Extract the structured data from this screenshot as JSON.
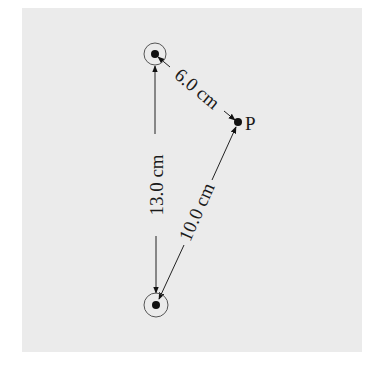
{
  "diagram": {
    "type": "charge-geometry",
    "background_color": "#ebebeb",
    "charges": [
      {
        "id": "charge-top",
        "x": 155,
        "y": 54
      },
      {
        "id": "charge-bottom",
        "x": 156,
        "y": 305
      }
    ],
    "point": {
      "label": "P",
      "x": 238,
      "y": 122
    },
    "distances": [
      {
        "from": "charge-top",
        "to": "P",
        "label": "6.0 cm"
      },
      {
        "from": "charge-top",
        "to": "charge-bottom",
        "label": "13.0 cm"
      },
      {
        "from": "charge-bottom",
        "to": "P",
        "label": "10.0 cm"
      }
    ]
  }
}
